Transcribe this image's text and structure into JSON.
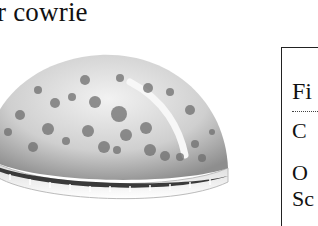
{
  "page": {
    "title": "r cowrie"
  },
  "illustration": {
    "subject": "cowrie shell (dorsal-lateral view, spotted)",
    "colors": {
      "shell_light": "#e8e8e8",
      "shell_mid": "#b8b8b8",
      "spot": "#6e6e6e",
      "aperture": "#3a3a3a"
    }
  },
  "info_box": {
    "heading": "Fi",
    "lines": [
      "C",
      "O",
      "Sc"
    ],
    "border_color": "#222222"
  }
}
